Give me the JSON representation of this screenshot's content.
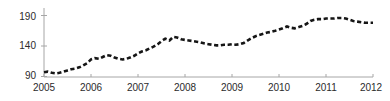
{
  "chart_data": {
    "type": "line",
    "title": "",
    "subtitle": "",
    "xlabel": "",
    "ylabel": "",
    "grid": false,
    "legend": "none",
    "line_style": "dashed",
    "line_color": "#161616",
    "axis_color": "#a6a6a6",
    "background": "#ffffff",
    "xlim": [
      2005.0,
      2012.0
    ],
    "ylim": [
      88,
      196
    ],
    "ytick_labels": [
      "90",
      "140",
      "190"
    ],
    "ytick_values": [
      90,
      140,
      190
    ],
    "xtick_labels": [
      "2005",
      "2006",
      "2007",
      "2008",
      "2009",
      "2010",
      "2011",
      "2012"
    ],
    "xtick_values": [
      2005,
      2006,
      2007,
      2008,
      2009,
      2010,
      2011,
      2012
    ],
    "series": [
      {
        "name": "index",
        "x": [
          2005.0,
          2005.08,
          2005.17,
          2005.25,
          2005.33,
          2005.42,
          2005.5,
          2005.58,
          2005.67,
          2005.75,
          2005.83,
          2005.92,
          2006.0,
          2006.08,
          2006.17,
          2006.25,
          2006.33,
          2006.42,
          2006.5,
          2006.58,
          2006.67,
          2006.75,
          2006.83,
          2006.92,
          2007.0,
          2007.08,
          2007.17,
          2007.25,
          2007.33,
          2007.42,
          2007.5,
          2007.58,
          2007.67,
          2007.75,
          2007.83,
          2007.92,
          2008.0,
          2008.08,
          2008.17,
          2008.25,
          2008.33,
          2008.42,
          2008.5,
          2008.58,
          2008.67,
          2008.75,
          2008.83,
          2008.92,
          2009.0,
          2009.08,
          2009.17,
          2009.25,
          2009.33,
          2009.42,
          2009.5,
          2009.58,
          2009.67,
          2009.75,
          2009.83,
          2009.92,
          2010.0,
          2010.08,
          2010.17,
          2010.25,
          2010.33,
          2010.42,
          2010.5,
          2010.58,
          2010.67,
          2010.75,
          2010.83,
          2010.92,
          2011.0,
          2011.08,
          2011.17,
          2011.25,
          2011.33,
          2011.42,
          2011.5,
          2011.58,
          2011.67,
          2011.75,
          2011.83,
          2011.92,
          2012.0
        ],
        "y": [
          97,
          98,
          96,
          95,
          96,
          98,
          100,
          102,
          103,
          105,
          108,
          112,
          118,
          120,
          119,
          122,
          125,
          124,
          121,
          119,
          118,
          119,
          121,
          124,
          128,
          131,
          133,
          136,
          139,
          143,
          148,
          152,
          149,
          155,
          154,
          151,
          150,
          149,
          148,
          147,
          146,
          144,
          143,
          142,
          141,
          141,
          142,
          142,
          143,
          142,
          143,
          145,
          149,
          153,
          156,
          158,
          160,
          162,
          163,
          165,
          167,
          169,
          172,
          170,
          169,
          171,
          173,
          176,
          181,
          183,
          184,
          184,
          185,
          185,
          185,
          186,
          186,
          185,
          183,
          181,
          180,
          179,
          178,
          178,
          178
        ]
      }
    ]
  },
  "axis": {
    "y_ticks": [
      {
        "label": "190",
        "top": 11
      },
      {
        "label": "140",
        "top": 40
      },
      {
        "label": "90",
        "top": 70
      }
    ],
    "x_ticks": [
      {
        "label": "2005",
        "left": 27
      },
      {
        "label": "2006",
        "left": 74
      },
      {
        "label": "2007",
        "left": 121
      },
      {
        "label": "2008",
        "left": 168
      },
      {
        "label": "2009",
        "left": 215
      },
      {
        "label": "2010",
        "left": 262
      },
      {
        "label": "2011",
        "left": 309
      },
      {
        "label": "2012",
        "left": 354
      }
    ]
  }
}
